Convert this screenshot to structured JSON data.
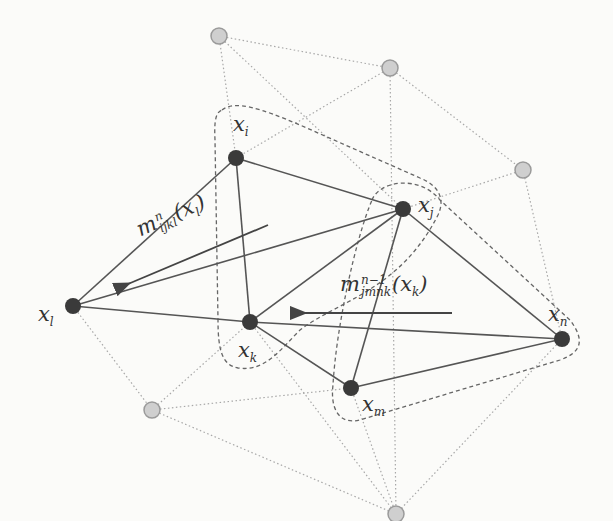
{
  "colors": {
    "background": "#fbfbf9",
    "dark_node": "#3a3a3a",
    "gray_node_fill": "#cfcfcf",
    "gray_node_stroke": "#9a9a9a",
    "solid_edge": "#555555",
    "dotted_edge": "#a8a8a8",
    "dashed_outline": "#666666",
    "arrow": "#444444"
  },
  "nodes": {
    "observed": [
      {
        "id": "xi",
        "label": "x",
        "sub": "i",
        "x": 236,
        "y": 158
      },
      {
        "id": "xj",
        "label": "x",
        "sub": "j",
        "x": 403,
        "y": 209
      },
      {
        "id": "xl",
        "label": "x",
        "sub": "l",
        "x": 73,
        "y": 306
      },
      {
        "id": "xk",
        "label": "x",
        "sub": "k",
        "x": 250,
        "y": 322
      },
      {
        "id": "xm",
        "label": "x",
        "sub": "m",
        "x": 351,
        "y": 388
      },
      {
        "id": "xn",
        "label": "x",
        "sub": "n",
        "x": 562,
        "y": 339
      }
    ],
    "unlabeled": [
      {
        "id": "g1",
        "x": 219,
        "y": 36
      },
      {
        "id": "g2",
        "x": 390,
        "y": 68
      },
      {
        "id": "g3",
        "x": 523,
        "y": 170
      },
      {
        "id": "g4",
        "x": 152,
        "y": 410
      },
      {
        "id": "g5",
        "x": 396,
        "y": 514
      }
    ]
  },
  "labels": {
    "xi": {
      "base": "x",
      "sub": "i"
    },
    "xj": {
      "base": "x",
      "sub": "j"
    },
    "xl": {
      "base": "x",
      "sub": "l"
    },
    "xk": {
      "base": "x",
      "sub": "k"
    },
    "xm": {
      "base": "x",
      "sub": "m"
    },
    "xn": {
      "base": "x",
      "sub": "n"
    }
  },
  "messages": {
    "m1": {
      "base": "m",
      "sup": "n",
      "sub": "ijkl",
      "arg_open": "(",
      "arg_base": "x",
      "arg_sub": "l",
      "arg_close": ")",
      "direction": "toward x_l"
    },
    "m2": {
      "base": "m",
      "sup": "n−1",
      "sub": "jmnk",
      "arg_open": "(",
      "arg_base": "x",
      "arg_sub": "k",
      "arg_close": ")",
      "direction": "toward x_k"
    }
  },
  "edges": {
    "solid": [
      [
        "xi",
        "xj"
      ],
      [
        "xi",
        "xl"
      ],
      [
        "xi",
        "xk"
      ],
      [
        "xj",
        "xl"
      ],
      [
        "xj",
        "xk"
      ],
      [
        "xj",
        "xm"
      ],
      [
        "xj",
        "xn"
      ],
      [
        "xl",
        "xk"
      ],
      [
        "xk",
        "xn"
      ],
      [
        "xk",
        "xm"
      ],
      [
        "xm",
        "xn"
      ]
    ],
    "dotted": [
      [
        "g1",
        "g2"
      ],
      [
        "g1",
        "xi"
      ],
      [
        "g1",
        "xj"
      ],
      [
        "g2",
        "xi"
      ],
      [
        "g2",
        "g3"
      ],
      [
        "g2",
        "g5"
      ],
      [
        "g3",
        "xj"
      ],
      [
        "g3",
        "xn"
      ],
      [
        "xl",
        "g4"
      ],
      [
        "g4",
        "xk"
      ],
      [
        "g4",
        "xm"
      ],
      [
        "g4",
        "g5"
      ],
      [
        "xk",
        "g5"
      ],
      [
        "xm",
        "g5"
      ],
      [
        "xn",
        "g5"
      ]
    ]
  },
  "cliques": [
    {
      "name": "clique-ijkl",
      "members": [
        "xi",
        "xj",
        "xk",
        "xl"
      ]
    },
    {
      "name": "clique-jmnk",
      "members": [
        "xj",
        "xm",
        "xn",
        "xk"
      ]
    }
  ]
}
